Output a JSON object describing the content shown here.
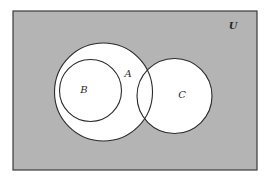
{
  "diagram": {
    "type": "venn",
    "universe": {
      "label": "U",
      "fill": "#b4b4b4",
      "stroke": "#3a3a3a",
      "x": 13,
      "y": 11,
      "width": 244,
      "height": 159,
      "label_x": 233,
      "label_y": 29
    },
    "sets": [
      {
        "id": "A",
        "label": "A",
        "cx": 103.5,
        "cy": 92,
        "r": 49,
        "fill": "#ffffff",
        "stroke": "#2a2a2a",
        "label_x": 128,
        "label_y": 77
      },
      {
        "id": "B",
        "label": "B",
        "cx": 90.5,
        "cy": 90.5,
        "r": 31,
        "fill": "#ffffff",
        "stroke": "#2a2a2a",
        "label_x": 84,
        "label_y": 93
      },
      {
        "id": "C",
        "label": "C",
        "cx": 174.5,
        "cy": 96,
        "r": 37.5,
        "fill": "#ffffff",
        "stroke": "#2a2a2a",
        "label_x": 182,
        "label_y": 98
      }
    ],
    "relations": {
      "B_subset_of_A": true,
      "A_intersects_C": true,
      "B_intersects_C": false
    }
  }
}
